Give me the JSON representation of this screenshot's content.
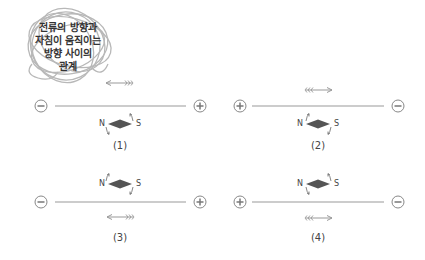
{
  "title": {
    "lines": [
      "전류의 방향과",
      "자침이 움직이는",
      "방향 사이의",
      "관계"
    ]
  },
  "colors": {
    "wire": "#888888",
    "needle": "#555555",
    "arrow": "#999999",
    "text": "#444444"
  },
  "panels": [
    {
      "label": "(1)",
      "left_terminal": "−",
      "right_terminal": "+",
      "current_arrow": "left",
      "arrow_position": "above",
      "needle_position": "below",
      "north_label": "N",
      "south_label": "S",
      "needle_rotation": "N down, S up"
    },
    {
      "label": "(2)",
      "left_terminal": "+",
      "right_terminal": "−",
      "current_arrow": "right",
      "arrow_position": "above",
      "needle_position": "below",
      "north_label": "N",
      "south_label": "S",
      "needle_rotation": "N up, S down"
    },
    {
      "label": "(3)",
      "left_terminal": "−",
      "right_terminal": "+",
      "current_arrow": "left",
      "arrow_position": "below",
      "needle_position": "above",
      "north_label": "N",
      "south_label": "S",
      "needle_rotation": "N up, S down"
    },
    {
      "label": "(4)",
      "left_terminal": "+",
      "right_terminal": "−",
      "current_arrow": "right",
      "arrow_position": "below",
      "needle_position": "above",
      "north_label": "N",
      "south_label": "S",
      "needle_rotation": "N down, S up"
    }
  ]
}
